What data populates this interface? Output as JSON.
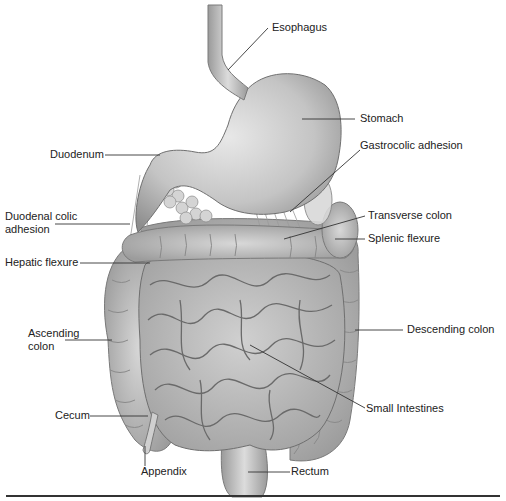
{
  "diagram": {
    "type": "anatomical-illustration",
    "labels": {
      "esophagus": "Esophagus",
      "stomach": "Stomach",
      "duodenum": "Duodenum",
      "gastrocolic_adhesion": "Gastrocolic adhesion",
      "duodenal_colic_adhesion_1": "Duodenal colic",
      "duodenal_colic_adhesion_2": "adhesion",
      "transverse_colon": "Transverse colon",
      "splenic_flexure": "Splenic flexure",
      "hepatic_flexure": "Hepatic flexure",
      "ascending_colon_1": "Ascending",
      "ascending_colon_2": "colon",
      "descending_colon": "Descending colon",
      "small_intestines": "Small Intestines",
      "cecum": "Cecum",
      "appendix": "Appendix",
      "rectum": "Rectum"
    },
    "colors": {
      "organ_fill": "#c9c9c9",
      "organ_shadow": "#8f8f8f",
      "organ_highlight": "#e6e6e6",
      "leader_line": "#333333",
      "text": "#222222"
    }
  }
}
